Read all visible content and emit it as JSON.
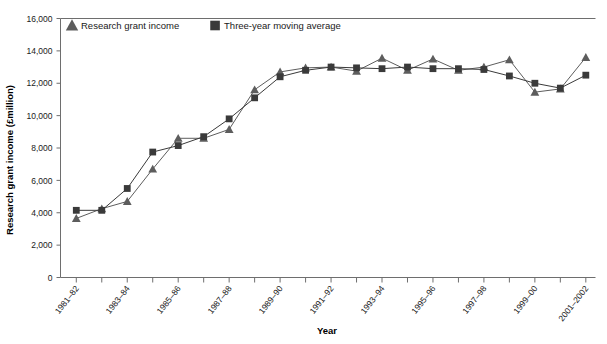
{
  "chart_data": {
    "type": "line",
    "title": "",
    "xlabel": "Year",
    "ylabel": "Research grant income (£million)",
    "ylim": [
      0,
      16000
    ],
    "ytick_step": 2000,
    "ytick_labels": [
      "0",
      "2,000",
      "4,000",
      "6,000",
      "8,000",
      "10,000",
      "12,000",
      "14,000",
      "16,000"
    ],
    "grid": false,
    "legend_position": "top-left-inside",
    "categories": [
      "1981–82",
      "1982–83",
      "1983–84",
      "1984–85",
      "1985–86",
      "1986–87",
      "1987–88",
      "1988–89",
      "1989–90",
      "1990–91",
      "1991–92",
      "1992–93",
      "1993–94",
      "1994–95",
      "1995–96",
      "1996–97",
      "1997–98",
      "1998–99",
      "1999–00",
      "2000–01",
      "2001–2002"
    ],
    "xtick_labels_shown": [
      "1981–82",
      "1983–84",
      "1985–86",
      "1987–88",
      "1989–90",
      "1991–92",
      "1993–94",
      "1995–96",
      "1997–98",
      "1999–00",
      "2001–2002"
    ],
    "series": [
      {
        "name": "Research grant income",
        "marker": "triangle",
        "color": "#5d5d5d",
        "values": [
          3650,
          4250,
          4700,
          6700,
          8600,
          8600,
          9150,
          11600,
          12700,
          12950,
          13000,
          12750,
          13550,
          12800,
          13500,
          12800,
          13000,
          13450,
          11450,
          11650,
          13600
        ]
      },
      {
        "name": "Three-year moving average",
        "marker": "square",
        "color": "#3a3a3a",
        "values": [
          4150,
          4150,
          5500,
          7750,
          8150,
          8700,
          9800,
          11100,
          12400,
          12800,
          13000,
          12950,
          12900,
          13000,
          12900,
          12900,
          12850,
          12450,
          12000,
          11700,
          12500
        ]
      }
    ]
  },
  "legend": {
    "items": [
      {
        "label": "Research grant income",
        "marker": "triangle",
        "color": "#5d5d5d"
      },
      {
        "label": "Three-year moving average",
        "marker": "square",
        "color": "#3a3a3a"
      }
    ]
  }
}
